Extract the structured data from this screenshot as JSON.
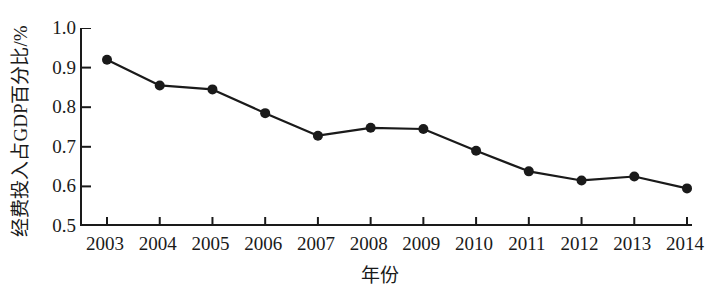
{
  "chart_data": {
    "type": "line",
    "title": "",
    "xlabel": "年份",
    "ylabel": "经费投入占GDP百分比/%",
    "categories": [
      "2003",
      "2004",
      "2005",
      "2006",
      "2007",
      "2008",
      "2009",
      "2010",
      "2011",
      "2012",
      "2013",
      "2014"
    ],
    "values": [
      0.92,
      0.855,
      0.845,
      0.785,
      0.728,
      0.748,
      0.745,
      0.69,
      0.638,
      0.615,
      0.625,
      0.595
    ],
    "series": [
      {
        "name": "经费投入占GDP百分比",
        "values": [
          0.92,
          0.855,
          0.845,
          0.785,
          0.728,
          0.748,
          0.745,
          0.69,
          0.638,
          0.615,
          0.625,
          0.595
        ]
      }
    ],
    "ylim": [
      0.5,
      1.0
    ],
    "y_ticks": [
      "1.0",
      "0.9",
      "0.8",
      "0.7",
      "0.6",
      "0.5"
    ],
    "y_tick_values": [
      1.0,
      0.9,
      0.8,
      0.7,
      0.6,
      0.5
    ],
    "x_ticks": [
      "2003",
      "2004",
      "2005",
      "2006",
      "2007",
      "2008",
      "2009",
      "2010",
      "2011",
      "2012",
      "2013",
      "2014"
    ],
    "grid": false,
    "legend": "none",
    "marker": "filled-circle",
    "line_color": "#1a1a1a",
    "marker_color": "#1a1a1a",
    "background_color": "#ffffff"
  }
}
